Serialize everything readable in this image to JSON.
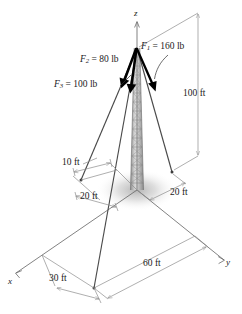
{
  "figure": {
    "type": "engineering-statics-free-body-diagram",
    "axes": {
      "x_label": "x",
      "y_label": "y",
      "z_label": "z"
    },
    "forces": [
      {
        "id": "F1",
        "symbol": "F",
        "subscript": "1",
        "equals": "=",
        "value": "160",
        "unit": "lb",
        "text": "F1 = 160 lb"
      },
      {
        "id": "F2",
        "symbol": "F",
        "subscript": "2",
        "equals": "=",
        "value": "80",
        "unit": "lb",
        "text": "F2 = 80 lb"
      },
      {
        "id": "F3",
        "symbol": "F",
        "subscript": "3",
        "equals": "=",
        "value": "100",
        "unit": "lb",
        "text": "F3 = 100 lb"
      }
    ],
    "dimensions": [
      {
        "id": "height",
        "text": "100 ft"
      },
      {
        "id": "ten-ft",
        "text": "10 ft"
      },
      {
        "id": "twenty-left",
        "text": "20 ft"
      },
      {
        "id": "twenty-right",
        "text": "20 ft"
      },
      {
        "id": "thirty",
        "text": "30 ft"
      },
      {
        "id": "sixty",
        "text": "60 ft"
      }
    ],
    "colors": {
      "line": "#4d4d4d",
      "dimension": "#8c8c8c",
      "force_arrow": "#000000",
      "tower": "#b3b3b3",
      "text": "#1a1a1a",
      "shadow": "#c8c8c8"
    }
  }
}
